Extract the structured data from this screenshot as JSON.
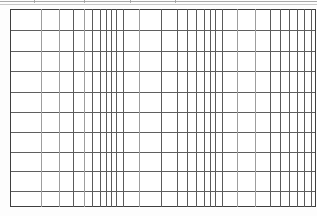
{
  "document": {
    "type": "scanned-table-grid",
    "title": "Blank ruled data table",
    "background_color": "#fdfdfd",
    "line_color": "#5a5a5a",
    "border_color": "#3f3f3f",
    "light_line_color": "#9d9d9d",
    "artifact_line_color": "#9a9a9a"
  },
  "grid": {
    "origin_x": 10,
    "origin_y": 9,
    "width": 306,
    "height": 198,
    "row_count": 10,
    "column_count": 31,
    "cells_are_empty": true,
    "horizontal_rules_y": [
      0,
      21,
      42,
      62,
      83,
      103,
      123,
      143,
      162,
      182,
      197
    ],
    "vertical_rules_x": [
      {
        "x": 0,
        "weight": "border"
      },
      {
        "x": 31,
        "weight": "light"
      },
      {
        "x": 49,
        "weight": "light"
      },
      {
        "x": 63,
        "weight": "normal"
      },
      {
        "x": 74,
        "weight": "light"
      },
      {
        "x": 82,
        "weight": "normal"
      },
      {
        "x": 90,
        "weight": "normal"
      },
      {
        "x": 96,
        "weight": "normal"
      },
      {
        "x": 101,
        "weight": "normal"
      },
      {
        "x": 106,
        "weight": "normal"
      },
      {
        "x": 113,
        "weight": "normal"
      },
      {
        "x": 129,
        "weight": "light"
      },
      {
        "x": 151,
        "weight": "normal"
      },
      {
        "x": 167,
        "weight": "normal"
      },
      {
        "x": 177,
        "weight": "normal"
      },
      {
        "x": 186,
        "weight": "normal"
      },
      {
        "x": 194,
        "weight": "normal"
      },
      {
        "x": 200,
        "weight": "normal"
      },
      {
        "x": 205,
        "weight": "normal"
      },
      {
        "x": 212,
        "weight": "normal"
      },
      {
        "x": 227,
        "weight": "light"
      },
      {
        "x": 245,
        "weight": "light"
      },
      {
        "x": 260,
        "weight": "normal"
      },
      {
        "x": 270,
        "weight": "normal"
      },
      {
        "x": 279,
        "weight": "normal"
      },
      {
        "x": 287,
        "weight": "normal"
      },
      {
        "x": 294,
        "weight": "normal"
      },
      {
        "x": 301,
        "weight": "normal"
      },
      {
        "x": 305,
        "weight": "border"
      }
    ]
  },
  "top_artifacts": {
    "rules": [
      {
        "x": 0,
        "y": 1,
        "width": 317,
        "faint": false
      },
      {
        "x": 0,
        "y": 4,
        "width": 317,
        "faint": true
      }
    ],
    "ticks": [
      {
        "x": 34,
        "y": 0,
        "height": 3
      },
      {
        "x": 84,
        "y": 0,
        "height": 3
      },
      {
        "x": 130,
        "y": 0,
        "height": 3
      },
      {
        "x": 175,
        "y": 0,
        "height": 3
      }
    ]
  }
}
